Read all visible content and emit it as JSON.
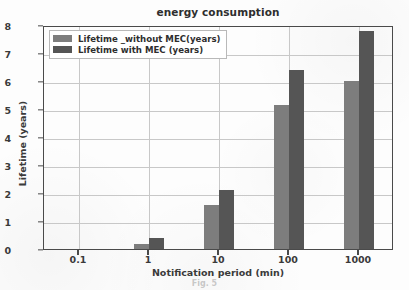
{
  "chart_data": {
    "type": "bar",
    "title": "energy consumption",
    "xlabel": "Notification period (min)",
    "ylabel": "Lifetime (years)",
    "categories": [
      "0.1",
      "1",
      "10",
      "100",
      "1000"
    ],
    "series": [
      {
        "name": "Lifetime _without MEC(years)",
        "color": "#7d7d7d",
        "values": [
          0,
          0.17,
          1.57,
          5.15,
          6.0
        ]
      },
      {
        "name": "Lifetime with MEC (years)",
        "color": "#555555",
        "values": [
          0,
          0.38,
          2.1,
          6.4,
          7.8
        ]
      }
    ],
    "ylim": [
      0,
      8
    ],
    "yticks": [
      "0",
      "1",
      "2",
      "3",
      "4",
      "5",
      "6",
      "7",
      "8"
    ],
    "xticks": [
      "0.1",
      "1",
      "10",
      "100",
      "1000"
    ],
    "grid": true,
    "legend_position": "upper left"
  },
  "caption": {
    "ghost_text": "Fig. 5"
  }
}
